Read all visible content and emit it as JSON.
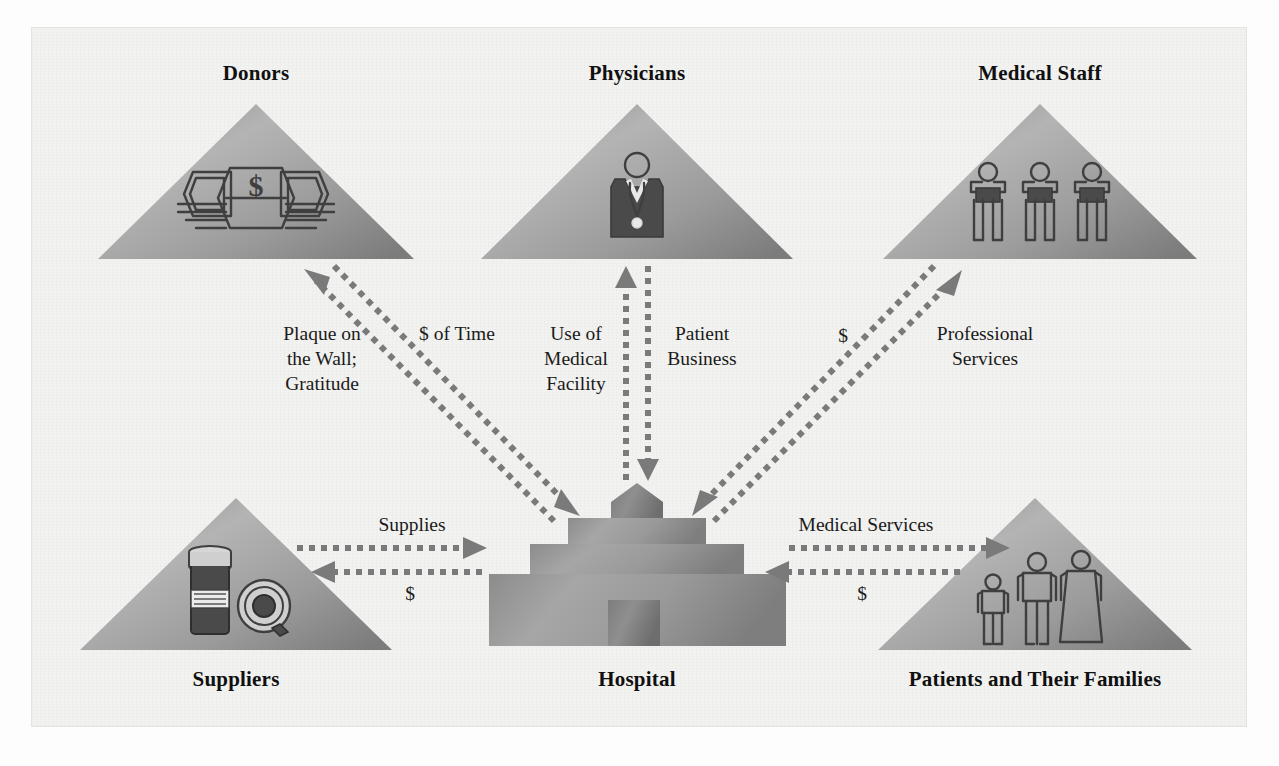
{
  "diagram": {
    "nodes": [
      {
        "id": "donors",
        "label": "Donors",
        "icon": "money-bills-icon",
        "shape": "triangle"
      },
      {
        "id": "physicians",
        "label": "Physicians",
        "icon": "physician-icon",
        "shape": "triangle"
      },
      {
        "id": "staff",
        "label": "Medical Staff",
        "icon": "three-staff-icon",
        "shape": "triangle"
      },
      {
        "id": "suppliers",
        "label": "Suppliers",
        "icon": "pill-bottle-icon",
        "shape": "triangle"
      },
      {
        "id": "hospital",
        "label": "Hospital",
        "icon": "hospital-building-icon",
        "shape": "building"
      },
      {
        "id": "patients",
        "label": "Patients and Their Families",
        "icon": "three-people-icon",
        "shape": "triangle"
      }
    ],
    "flows": [
      {
        "id": "donors-to-hospital",
        "label": "Plaque on\nthe Wall;\nGratitude",
        "from": "hospital",
        "to": "donors"
      },
      {
        "id": "hospital-from-donors",
        "label": "$ of Time",
        "from": "donors",
        "to": "hospital"
      },
      {
        "id": "physicians-use",
        "label": "Use of\nMedical\nFacility",
        "from": "hospital",
        "to": "physicians"
      },
      {
        "id": "physicians-business",
        "label": "Patient\nBusiness",
        "from": "physicians",
        "to": "hospital"
      },
      {
        "id": "staff-money",
        "label": "$",
        "from": "hospital",
        "to": "staff"
      },
      {
        "id": "staff-services",
        "label": "Professional\nServices",
        "from": "staff",
        "to": "hospital"
      },
      {
        "id": "suppliers-supplies",
        "label": "Supplies",
        "from": "suppliers",
        "to": "hospital"
      },
      {
        "id": "suppliers-money",
        "label": "$",
        "from": "hospital",
        "to": "suppliers"
      },
      {
        "id": "patients-services",
        "label": "Medical Services",
        "from": "hospital",
        "to": "patients"
      },
      {
        "id": "patients-money",
        "label": "$",
        "from": "patients",
        "to": "hospital"
      }
    ],
    "flow_label_lines": {
      "plaque": [
        "Plaque on",
        "the Wall;",
        "Gratitude"
      ],
      "dollar_time": [
        "$ of Time"
      ],
      "use_medical": [
        "Use of",
        "Medical",
        "Facility"
      ],
      "patient_biz": [
        "Patient",
        "Business"
      ],
      "staff_money": [
        "$"
      ],
      "professional": [
        "Professional",
        "Services"
      ],
      "supplies": [
        "Supplies"
      ],
      "supplier_money": [
        "$"
      ],
      "medical_services": [
        "Medical Services"
      ],
      "patient_money": [
        "$"
      ]
    },
    "colors": {
      "background": "#f2f2f0",
      "page": "#fdfdfd",
      "triangle_light": "#c6c6c6",
      "triangle_mid": "#8f8f8f",
      "triangle_dark": "#6e6e6e",
      "arrow": "#7a7a7a",
      "text": "#101010",
      "icon": "#3f3f3f"
    }
  }
}
